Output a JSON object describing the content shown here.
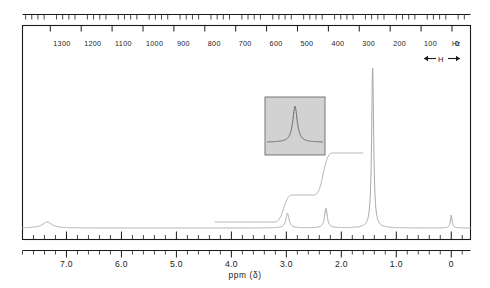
{
  "figure": {
    "kind": "nmr-spectrum-chart",
    "frame_color": "#1a1a1a",
    "trace_color": "#9a9a9a",
    "inset_fill": "#d2d2d2",
    "background": "#ffffff"
  },
  "top_axis": {
    "unit_label": "Hz",
    "labels": [
      "1300",
      "1200",
      "1100",
      "1000",
      "900",
      "800",
      "700",
      "600",
      "500",
      "400",
      "300",
      "200",
      "100",
      "0"
    ],
    "sweep_marker": "H"
  },
  "bottom_axis": {
    "caption": "ppm (δ)",
    "labels": [
      "7.0",
      "6.0",
      "5.0",
      "4.0",
      "3.0",
      "2.0",
      "1.0",
      "0"
    ]
  },
  "chart_data": {
    "type": "line",
    "title": "",
    "subtitle": "",
    "xlabel": "ppm (δ)",
    "ylabel": "",
    "xlim": [
      7.8,
      -0.35
    ],
    "ylim": [
      0,
      1
    ],
    "grid": false,
    "legend_position": "none",
    "x_axis_secondary": {
      "label": "Hz",
      "range": [
        1390,
        -60
      ],
      "tick_labels": [
        "1300",
        "1200",
        "1100",
        "1000",
        "900",
        "800",
        "700",
        "600",
        "500",
        "400",
        "300",
        "200",
        "100",
        "0"
      ],
      "tick_values": [
        1300,
        1200,
        1100,
        1000,
        900,
        800,
        700,
        600,
        500,
        400,
        300,
        200,
        100,
        0
      ],
      "minor_tick_step": 20
    },
    "x_axis_primary": {
      "label": "ppm (δ)",
      "range": [
        7.8,
        -0.35
      ],
      "tick_labels": [
        "7.0",
        "6.0",
        "5.0",
        "4.0",
        "3.0",
        "2.0",
        "1.0",
        "0"
      ],
      "tick_values": [
        7.0,
        6.0,
        5.0,
        4.0,
        3.0,
        2.0,
        1.0,
        0.0
      ],
      "minor_tick_step": 0.2
    },
    "series": [
      {
        "name": "1H NMR trace",
        "kind": "spectrum",
        "peaks": [
          {
            "ppm": 7.35,
            "height": 0.035,
            "width": 0.1,
            "label": ""
          },
          {
            "ppm": 2.98,
            "height": 0.085,
            "width": 0.035,
            "label": ""
          },
          {
            "ppm": 2.28,
            "height": 0.115,
            "width": 0.03,
            "label": ""
          },
          {
            "ppm": 1.43,
            "height": 0.93,
            "width": 0.022,
            "label": ""
          },
          {
            "ppm": 0.0,
            "height": 0.075,
            "width": 0.018,
            "label": "TMS"
          }
        ],
        "baseline": 0.0
      },
      {
        "name": "integral",
        "kind": "step-integral",
        "steps": [
          {
            "ppm": 3.05,
            "rise": 0.09
          },
          {
            "ppm": 2.33,
            "rise": 0.14
          }
        ],
        "start_level": 0.0
      }
    ],
    "inset": {
      "name": "expansion-inset",
      "description": "expanded single resonance",
      "fill": "#d2d2d2",
      "peak_center_fraction": 0.5,
      "peak_height_fraction": 0.62
    }
  }
}
